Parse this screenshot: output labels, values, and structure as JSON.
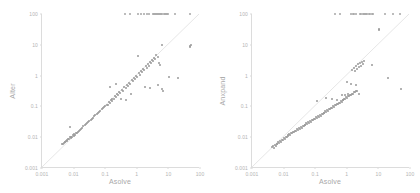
{
  "figure": {
    "background": "#ffffff",
    "dot_color": "#9a9a9a",
    "axis_color": "#dcdcdc",
    "tick_text_color": "#b4b4b4",
    "label_color": "#a8a8a8"
  },
  "chart_data": [
    {
      "type": "scatter",
      "title": "",
      "xlabel": "Asolve",
      "ylabel": "Alter",
      "xscale": "log",
      "yscale": "log",
      "xlim": [
        0.001,
        100
      ],
      "ylim": [
        0.001,
        100
      ],
      "xticks": [
        "0.001",
        "0.01",
        "0.1",
        "1",
        "10",
        "100"
      ],
      "yticks": [
        "0.001",
        "0.01",
        "0.1",
        "1",
        "10",
        "100"
      ],
      "grid": false,
      "legend": null,
      "annotations": [
        "diagonal y = x reference line"
      ],
      "points": [
        [
          0.0043,
          0.0062
        ],
        [
          0.0046,
          0.0058
        ],
        [
          0.005,
          0.0065
        ],
        [
          0.0052,
          0.0072
        ],
        [
          0.0055,
          0.0068
        ],
        [
          0.0058,
          0.0078
        ],
        [
          0.0061,
          0.0082
        ],
        [
          0.0064,
          0.0075
        ],
        [
          0.0068,
          0.009
        ],
        [
          0.0072,
          0.0085
        ],
        [
          0.0076,
          0.0098
        ],
        [
          0.008,
          0.0092
        ],
        [
          0.0085,
          0.0105
        ],
        [
          0.009,
          0.01
        ],
        [
          0.0095,
          0.0115
        ],
        [
          0.01,
          0.0108
        ],
        [
          0.0105,
          0.0125
        ],
        [
          0.0112,
          0.0118
        ],
        [
          0.012,
          0.0135
        ],
        [
          0.0078,
          0.021
        ],
        [
          0.0128,
          0.0142
        ],
        [
          0.0138,
          0.015
        ],
        [
          0.0148,
          0.0165
        ],
        [
          0.016,
          0.0172
        ],
        [
          0.0175,
          0.019
        ],
        [
          0.019,
          0.0205
        ],
        [
          0.0205,
          0.0225
        ],
        [
          0.0225,
          0.024
        ],
        [
          0.0245,
          0.0265
        ],
        [
          0.0265,
          0.0285
        ],
        [
          0.029,
          0.031
        ],
        [
          0.0315,
          0.034
        ],
        [
          0.0345,
          0.0365
        ],
        [
          0.0375,
          0.04
        ],
        [
          0.041,
          0.0435
        ],
        [
          0.045,
          0.047
        ],
        [
          0.049,
          0.052
        ],
        [
          0.054,
          0.056
        ],
        [
          0.059,
          0.062
        ],
        [
          0.064,
          0.067
        ],
        [
          0.07,
          0.073
        ],
        [
          0.077,
          0.08
        ],
        [
          0.084,
          0.088
        ],
        [
          0.092,
          0.095
        ],
        [
          0.1,
          0.105
        ],
        [
          0.11,
          0.115
        ],
        [
          0.12,
          0.115
        ],
        [
          0.13,
          0.14
        ],
        [
          0.14,
          0.125
        ],
        [
          0.15,
          0.16
        ],
        [
          0.16,
          0.145
        ],
        [
          0.17,
          0.18
        ],
        [
          0.145,
          0.42
        ],
        [
          0.19,
          0.17
        ],
        [
          0.2,
          0.21
        ],
        [
          0.22,
          0.195
        ],
        [
          0.24,
          0.25
        ],
        [
          0.26,
          0.23
        ],
        [
          0.28,
          0.29
        ],
        [
          0.3,
          0.27
        ],
        [
          0.33,
          0.34
        ],
        [
          0.36,
          0.32
        ],
        [
          0.225,
          0.54
        ],
        [
          0.4,
          0.42
        ],
        [
          0.44,
          0.39
        ],
        [
          0.48,
          0.5
        ],
        [
          0.52,
          0.46
        ],
        [
          0.57,
          0.59
        ],
        [
          0.62,
          0.55
        ],
        [
          0.68,
          0.7
        ],
        [
          0.74,
          0.66
        ],
        [
          0.8,
          0.83
        ],
        [
          0.88,
          0.78
        ],
        [
          0.31,
          0.175
        ],
        [
          0.46,
          0.165
        ],
        [
          0.96,
          0.99
        ],
        [
          1.05,
          0.92
        ],
        [
          1.15,
          1.2
        ],
        [
          1.25,
          1.08
        ],
        [
          0.65,
          0.25
        ],
        [
          1.35,
          1.4
        ],
        [
          1.5,
          1.3
        ],
        [
          1.6,
          1.7
        ],
        [
          1.75,
          1.55
        ],
        [
          1.9,
          2.0
        ],
        [
          2.05,
          1.8
        ],
        [
          2.2,
          2.3
        ],
        [
          2.4,
          2.1
        ],
        [
          1.1,
          4.3
        ],
        [
          2.6,
          2.8
        ],
        [
          2.8,
          2.5
        ],
        [
          3.0,
          3.2
        ],
        [
          3.3,
          2.9
        ],
        [
          3.6,
          3.8
        ],
        [
          3.9,
          3.4
        ],
        [
          4.2,
          4.5
        ],
        [
          4.6,
          4.0
        ],
        [
          5.0,
          2.6
        ],
        [
          5.5,
          2.2
        ],
        [
          1.8,
          0.44
        ],
        [
          2.6,
          0.41
        ],
        [
          4.6,
          0.48
        ],
        [
          6.2,
          0.37
        ],
        [
          6.8,
          0.32
        ],
        [
          6.5,
          9.5
        ],
        [
          10.5,
          0.92
        ],
        [
          20.0,
          0.84
        ],
        [
          48.0,
          9.0
        ],
        [
          52.0,
          9.6
        ],
        [
          50.0,
          8.4
        ]
      ],
      "ceiling_points": [
        [
          0.42,
          100
        ],
        [
          0.62,
          100
        ],
        [
          1.1,
          100
        ],
        [
          1.35,
          100
        ],
        [
          1.65,
          100
        ],
        [
          2.1,
          100
        ],
        [
          2.45,
          100
        ],
        [
          3.3,
          100
        ],
        [
          3.6,
          100
        ],
        [
          3.9,
          100
        ],
        [
          4.2,
          100
        ],
        [
          4.5,
          100
        ],
        [
          4.8,
          100
        ],
        [
          5.1,
          100
        ],
        [
          5.5,
          100
        ],
        [
          5.9,
          100
        ],
        [
          6.4,
          100
        ],
        [
          7.0,
          100
        ],
        [
          7.6,
          100
        ],
        [
          8.2,
          100
        ],
        [
          8.9,
          100
        ],
        [
          9.6,
          100
        ],
        [
          16.0,
          100
        ],
        [
          48.0,
          100
        ]
      ],
      "ceiling_note": "points saturated at the upper limit of 100"
    },
    {
      "type": "scatter",
      "title": "",
      "xlabel": "Asolve",
      "ylabel": "Anxpand",
      "xscale": "log",
      "yscale": "log",
      "xlim": [
        0.001,
        100
      ],
      "ylim": [
        0.001,
        100
      ],
      "xticks": [
        "0.001",
        "0.01",
        "0.1",
        "1",
        "10",
        "100"
      ],
      "yticks": [
        "0.001",
        "0.01",
        "0.1",
        "1",
        "10",
        "100"
      ],
      "grid": false,
      "legend": null,
      "annotations": [
        "diagonal y = x reference line"
      ],
      "points": [
        [
          0.0043,
          0.0048
        ],
        [
          0.0046,
          0.0052
        ],
        [
          0.0049,
          0.0046
        ],
        [
          0.0052,
          0.0056
        ],
        [
          0.0056,
          0.0051
        ],
        [
          0.006,
          0.0062
        ],
        [
          0.0064,
          0.0058
        ],
        [
          0.0068,
          0.0068
        ],
        [
          0.0073,
          0.0064
        ],
        [
          0.0078,
          0.0076
        ],
        [
          0.0083,
          0.0072
        ],
        [
          0.0089,
          0.0084
        ],
        [
          0.0095,
          0.008
        ],
        [
          0.0101,
          0.0094
        ],
        [
          0.0108,
          0.009
        ],
        [
          0.0116,
          0.0104
        ],
        [
          0.0124,
          0.0098
        ],
        [
          0.0133,
          0.0115
        ],
        [
          0.0142,
          0.0108
        ],
        [
          0.0152,
          0.0126
        ],
        [
          0.0163,
          0.012
        ],
        [
          0.0175,
          0.0138
        ],
        [
          0.0187,
          0.0132
        ],
        [
          0.02,
          0.015
        ],
        [
          0.0215,
          0.0145
        ],
        [
          0.023,
          0.0165
        ],
        [
          0.0246,
          0.0158
        ],
        [
          0.0264,
          0.018
        ],
        [
          0.0283,
          0.0172
        ],
        [
          0.0303,
          0.0196
        ],
        [
          0.0325,
          0.0188
        ],
        [
          0.0348,
          0.0215
        ],
        [
          0.0373,
          0.0205
        ],
        [
          0.04,
          0.0235
        ],
        [
          0.0428,
          0.0225
        ],
        [
          0.0459,
          0.0258
        ],
        [
          0.0492,
          0.0246
        ],
        [
          0.0527,
          0.0282
        ],
        [
          0.0565,
          0.027
        ],
        [
          0.0605,
          0.0308
        ],
        [
          0.0649,
          0.0295
        ],
        [
          0.0695,
          0.0336
        ],
        [
          0.0745,
          0.0322
        ],
        [
          0.0798,
          0.0368
        ],
        [
          0.0855,
          0.0352
        ],
        [
          0.0917,
          0.0402
        ],
        [
          0.0982,
          0.0385
        ],
        [
          0.1053,
          0.044
        ],
        [
          0.1128,
          0.042
        ],
        [
          0.1209,
          0.048
        ],
        [
          0.1296,
          0.046
        ],
        [
          0.1389,
          0.0525
        ],
        [
          0.1488,
          0.0505
        ],
        [
          0.115,
          0.145
        ],
        [
          0.1595,
          0.0575
        ],
        [
          0.1709,
          0.0555
        ],
        [
          0.1832,
          0.063
        ],
        [
          0.1963,
          0.061
        ],
        [
          0.2104,
          0.069
        ],
        [
          0.2255,
          0.067
        ],
        [
          0.2417,
          0.0755
        ],
        [
          0.259,
          0.0735
        ],
        [
          0.2776,
          0.083
        ],
        [
          0.2975,
          0.0805
        ],
        [
          0.3189,
          0.091
        ],
        [
          0.3418,
          0.0885
        ],
        [
          0.3663,
          0.1
        ],
        [
          0.3926,
          0.097
        ],
        [
          0.4208,
          0.11
        ],
        [
          0.451,
          0.107
        ],
        [
          0.4834,
          0.121
        ],
        [
          0.5181,
          0.118
        ],
        [
          0.5553,
          0.133
        ],
        [
          0.5951,
          0.13
        ],
        [
          0.6378,
          0.147
        ],
        [
          0.6836,
          0.143
        ],
        [
          0.22,
          0.185
        ],
        [
          0.33,
          0.175
        ],
        [
          0.48,
          0.165
        ],
        [
          0.7327,
          0.162
        ],
        [
          0.7853,
          0.158
        ],
        [
          0.8417,
          0.178
        ],
        [
          0.9021,
          0.174
        ],
        [
          0.9669,
          0.196
        ],
        [
          1.0363,
          0.192
        ],
        [
          1.1107,
          0.216
        ],
        [
          1.1904,
          0.211
        ],
        [
          1.2758,
          0.238
        ],
        [
          1.3674,
          0.233
        ],
        [
          1.4656,
          0.262
        ],
        [
          1.5708,
          0.256
        ],
        [
          1.6836,
          0.289
        ],
        [
          1.8045,
          0.283
        ],
        [
          1.934,
          0.318
        ],
        [
          2.0729,
          0.311
        ],
        [
          1.5,
          1.5
        ],
        [
          1.65,
          1.8
        ],
        [
          1.8,
          1.4
        ],
        [
          1.95,
          2.0
        ],
        [
          2.1,
          1.65
        ],
        [
          2.25,
          2.3
        ],
        [
          2.4,
          1.9
        ],
        [
          2.6,
          2.5
        ],
        [
          2.8,
          2.1
        ],
        [
          3.0,
          2.8
        ],
        [
          3.2,
          2.4
        ],
        [
          3.4,
          3.0
        ],
        [
          1.0,
          0.62
        ],
        [
          1.4,
          0.54
        ],
        [
          2.0,
          0.48
        ],
        [
          2.4,
          0.26
        ],
        [
          1.1,
          0.245
        ],
        [
          0.7,
          0.235
        ],
        [
          0.9,
          0.23
        ],
        [
          6.2,
          2.2
        ],
        [
          10.5,
          33.0
        ],
        [
          10.8,
          30.0
        ],
        [
          20.0,
          0.82
        ],
        [
          52.0,
          0.38
        ]
      ],
      "ceiling_points": [
        [
          0.42,
          100
        ],
        [
          0.62,
          100
        ],
        [
          1.35,
          100
        ],
        [
          1.55,
          100
        ],
        [
          1.75,
          100
        ],
        [
          1.95,
          100
        ],
        [
          2.6,
          100
        ],
        [
          2.9,
          100
        ],
        [
          3.2,
          100
        ],
        [
          3.5,
          100
        ],
        [
          3.8,
          100
        ],
        [
          4.1,
          100
        ],
        [
          4.5,
          100
        ],
        [
          5.1,
          100
        ],
        [
          5.6,
          100
        ],
        [
          6.1,
          100
        ],
        [
          6.6,
          100
        ],
        [
          16.0,
          100
        ],
        [
          30.0,
          100
        ],
        [
          48.0,
          100
        ]
      ],
      "ceiling_note": "points saturated at the upper limit of 100"
    }
  ]
}
